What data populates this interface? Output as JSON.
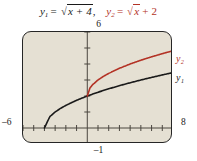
{
  "caption": {
    "eq1": {
      "lhs": "y",
      "sub": "1",
      "eq": "=",
      "radical_sign": "√",
      "radicand": "x + 4",
      "trailing": "",
      "separator": ","
    },
    "eq2": {
      "lhs": "y",
      "sub": "2",
      "eq": "=",
      "radical_sign": "√",
      "radicand": "x",
      "trailing": "+ 2",
      "separator": ""
    }
  },
  "window": {
    "ymax_label": "6",
    "ymin_label": "–1",
    "xmin_label": "–6",
    "xmax_label": "8"
  },
  "curve_labels": {
    "y2": "y₂",
    "y1": "y₁"
  },
  "colors": {
    "plot_background": "#e5e0d3",
    "frame": "#262626",
    "curve_y1": "#1a1a1a",
    "curve_y2": "#b33225",
    "axis": "#4a463f",
    "page_background": "#ffffff"
  },
  "chart_data": {
    "type": "line",
    "xlabel": "",
    "ylabel": "",
    "xlim": [
      -6,
      8
    ],
    "ylim": [
      -1,
      6
    ],
    "xtick_step": 1,
    "ytick_step": 1,
    "grid": false,
    "legend_position": "right-of-axes",
    "axes_style": "graphing-calculator-window",
    "series": [
      {
        "name": "y₁",
        "label": "y1 = √(x + 4)",
        "color": "#1a1a1a",
        "domain_start": -4,
        "domain_end": 8,
        "x": [
          -4,
          -3.5,
          -3,
          -2.5,
          -2,
          -1,
          0,
          1,
          2,
          3,
          4,
          5,
          6,
          7,
          8
        ],
        "y": [
          0,
          0.707,
          1,
          1.225,
          1.414,
          1.732,
          2,
          2.236,
          2.449,
          2.646,
          2.828,
          3,
          3.162,
          3.317,
          3.464
        ]
      },
      {
        "name": "y₂",
        "label": "y2 = √x + 2",
        "color": "#b33225",
        "domain_start": 0,
        "domain_end": 8,
        "x": [
          0,
          0.25,
          0.5,
          1,
          1.5,
          2,
          3,
          4,
          5,
          6,
          7,
          8
        ],
        "y": [
          2,
          2.5,
          2.707,
          3,
          3.225,
          3.414,
          3.732,
          4,
          4.236,
          4.449,
          4.646,
          4.828
        ]
      }
    ],
    "annotations": [
      {
        "text": "6",
        "position": "above-axes-center",
        "meaning": "y-max of viewing window"
      },
      {
        "text": "–1",
        "position": "below-axes-center",
        "meaning": "y-min of viewing window"
      },
      {
        "text": "–6",
        "position": "left-of-axes",
        "meaning": "x-min of viewing window"
      },
      {
        "text": "8",
        "position": "right-of-axes",
        "meaning": "x-max of viewing window"
      }
    ]
  }
}
